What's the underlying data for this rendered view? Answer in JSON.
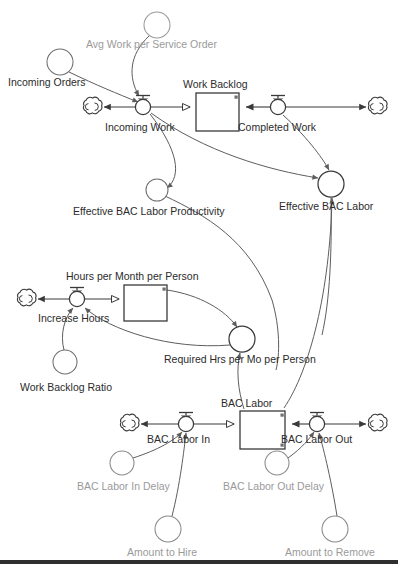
{
  "diagram": {
    "type": "stock-and-flow",
    "canvas": {
      "width": 398,
      "height": 564,
      "background": "#ffffff"
    },
    "colors": {
      "label_dark": "#2b2b2b",
      "label_gray": "#9a9a9a",
      "line": "#5d5d5d",
      "stock_border": "#3a3a3a"
    }
  },
  "stocks": [
    {
      "id": "work_backlog",
      "label": "Work Backlog",
      "x": 196,
      "y": 93,
      "w": 43,
      "h": 38
    },
    {
      "id": "hours_per_month_per_person",
      "label": "Hours per Month per Person",
      "x": 124,
      "y": 285,
      "w": 43,
      "h": 36
    },
    {
      "id": "bac_labor",
      "label": "BAC Labor",
      "x": 240,
      "y": 411,
      "w": 45,
      "h": 38
    }
  ],
  "flows": [
    {
      "id": "incoming_work",
      "label": "Incoming Work",
      "x": 143,
      "y": 107,
      "source": "cloud_left_top",
      "target": "work_backlog"
    },
    {
      "id": "completed_work",
      "label": "Completed Work",
      "x": 278,
      "y": 107,
      "source": "cloud_right_top",
      "target": "work_backlog"
    },
    {
      "id": "increase_hours",
      "label": "Increase Hours",
      "x": 77,
      "y": 299,
      "source": "cloud_left_mid",
      "target": "hours_per_month_per_person"
    },
    {
      "id": "bac_labor_in",
      "label": "BAC Labor In",
      "x": 186,
      "y": 424,
      "source": "cloud_left_bottom",
      "target": "bac_labor"
    },
    {
      "id": "bac_labor_out",
      "label": "BAC Labor Out",
      "x": 317,
      "y": 424,
      "source": "bac_labor",
      "target": "cloud_right_bottom"
    }
  ],
  "auxiliaries": [
    {
      "id": "avg_work_per_service_order",
      "label": "Avg Work per Service Order",
      "x": 157,
      "y": 25,
      "r": 13,
      "tone": "gray",
      "label_x": 86,
      "label_y": 45
    },
    {
      "id": "incoming_orders",
      "label": "Incoming Orders",
      "x": 60,
      "y": 62,
      "r": 13,
      "tone": "dark",
      "label_x": 8,
      "label_y": 83
    },
    {
      "id": "effective_bac_labor_productivity",
      "label": "Effective BAC Labor Productivity",
      "x": 157,
      "y": 190,
      "r": 11,
      "tone": "dark",
      "label_x": 73,
      "label_y": 212
    },
    {
      "id": "effective_bac_labor",
      "label": "Effective BAC Labor",
      "x": 331,
      "y": 184,
      "r": 13,
      "tone": "dark",
      "label_x": 279,
      "label_y": 207
    },
    {
      "id": "work_backlog_ratio",
      "label": "Work Backlog Ratio",
      "x": 65,
      "y": 362,
      "r": 12,
      "tone": "dark",
      "label_x": 20,
      "label_y": 388
    },
    {
      "id": "required_hrs_per_mo_per_person",
      "label": "Required Hrs per Mo per Person",
      "x": 242,
      "y": 339,
      "r": 13,
      "tone": "dark",
      "label_x": 164,
      "label_y": 360
    },
    {
      "id": "bac_labor_in_delay",
      "label": "BAC Labor In Delay",
      "x": 122,
      "y": 463,
      "r": 12,
      "tone": "gray",
      "label_x": 77,
      "label_y": 487
    },
    {
      "id": "bac_labor_out_delay",
      "label": "BAC Labor Out Delay",
      "x": 277,
      "y": 463,
      "r": 12,
      "tone": "gray",
      "label_x": 223,
      "label_y": 487
    },
    {
      "id": "amount_to_hire",
      "label": "Amount to Hire",
      "x": 168,
      "y": 529,
      "r": 13,
      "tone": "gray",
      "label_x": 127,
      "label_y": 553
    },
    {
      "id": "amount_to_remove",
      "label": "Amount to Remove",
      "x": 335,
      "y": 529,
      "r": 13,
      "tone": "gray",
      "label_x": 285,
      "label_y": 553
    }
  ],
  "clouds": [
    {
      "id": "cloud_left_top",
      "x": 93,
      "y": 107
    },
    {
      "id": "cloud_right_top",
      "x": 331,
      "y": 107
    },
    {
      "id": "cloud_left_mid",
      "x": 27,
      "y": 299
    },
    {
      "id": "cloud_left_bottom",
      "x": 130,
      "y": 424
    },
    {
      "id": "cloud_right_bottom",
      "x": 376,
      "y": 424
    }
  ],
  "links": [
    {
      "from": "incoming_orders",
      "to": "incoming_work"
    },
    {
      "from": "avg_work_per_service_order",
      "to": "incoming_work"
    },
    {
      "from": "incoming_work",
      "to": "effective_bac_labor_productivity"
    },
    {
      "from": "incoming_work",
      "to": "effective_bac_labor"
    },
    {
      "from": "completed_work",
      "to": "effective_bac_labor"
    },
    {
      "from": "effective_bac_labor_productivity",
      "to": "completed_work"
    },
    {
      "from": "effective_bac_labor",
      "to": "completed_work"
    },
    {
      "from": "hours_per_month_per_person",
      "to": "required_hrs_per_mo_per_person"
    },
    {
      "from": "required_hrs_per_mo_per_person",
      "to": "increase_hours"
    },
    {
      "from": "work_backlog_ratio",
      "to": "increase_hours"
    },
    {
      "from": "bac_labor",
      "to": "required_hrs_per_mo_per_person"
    },
    {
      "from": "bac_labor",
      "to": "effective_bac_labor"
    },
    {
      "from": "bac_labor_in_delay",
      "to": "bac_labor_in"
    },
    {
      "from": "amount_to_hire",
      "to": "bac_labor_in"
    },
    {
      "from": "bac_labor_out_delay",
      "to": "bac_labor_out"
    },
    {
      "from": "amount_to_remove",
      "to": "bac_labor_out"
    }
  ]
}
